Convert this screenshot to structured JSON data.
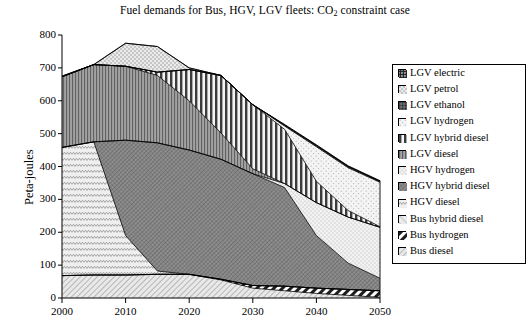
{
  "title": {
    "text_before": "Fuel demands for Bus, HGV, LGV fleets: CO",
    "subscript": "2",
    "text_after": " constraint case",
    "full": "Fuel demands for Bus, HGV, LGV fleets: CO2 constraint case"
  },
  "axes": {
    "ylabel": "Peta-joules",
    "yticks": [
      "0",
      "100",
      "200",
      "300",
      "400",
      "500",
      "600",
      "700",
      "800"
    ],
    "xticks": [
      "2000",
      "2010",
      "2020",
      "2030",
      "2040",
      "2050"
    ]
  },
  "legend": {
    "items": [
      {
        "label": "LGV electric",
        "pattern": "grid-dense-dark",
        "color": "#909090"
      },
      {
        "label": "LGV petrol",
        "pattern": "dot-sparse",
        "color": "#e8e8e8"
      },
      {
        "label": "LGV ethanol",
        "pattern": "grid-solid-dark",
        "color": "#707070"
      },
      {
        "label": "LGV hydrogen",
        "pattern": "dot-fine-light",
        "color": "#efefef"
      },
      {
        "label": "LGV hybrid diesel",
        "pattern": "vertical-thick",
        "color": "#a8a8a8"
      },
      {
        "label": "LGV diesel",
        "pattern": "vertical-fine",
        "color": "#9a9a9a"
      },
      {
        "label": "HGV hydrogen",
        "pattern": "dot-light-box",
        "color": "#ededed"
      },
      {
        "label": "HGV hybrid diesel",
        "pattern": "cross-dense",
        "color": "#8a8a8a"
      },
      {
        "label": "HGV diesel",
        "pattern": "wave-light",
        "color": "#e4e4e4"
      },
      {
        "label": "Bus hybrid diesel",
        "pattern": "diag-light",
        "color": "#e0e0e0"
      },
      {
        "label": "Bus hydrogen",
        "pattern": "diag-thick-dark",
        "color": "#2a2a2a"
      },
      {
        "label": "Bus diesel",
        "pattern": "diag-fine",
        "color": "#dcdcdc"
      }
    ]
  },
  "chart_data": {
    "type": "area",
    "stacked": true,
    "title": "Fuel demands for Bus, HGV, LGV fleets: CO2 constraint case",
    "xlabel": "",
    "ylabel": "Peta-joules",
    "xlim": [
      2000,
      2050
    ],
    "ylim": [
      0,
      800
    ],
    "grid": false,
    "legend_position": "right",
    "x": [
      2000,
      2005,
      2010,
      2015,
      2020,
      2025,
      2030,
      2035,
      2040,
      2045,
      2050
    ],
    "stack_order_bottom_to_top": [
      "Bus diesel",
      "Bus hydrogen",
      "Bus hybrid diesel",
      "HGV diesel",
      "HGV hybrid diesel",
      "HGV hydrogen",
      "LGV diesel",
      "LGV hybrid diesel",
      "LGV hydrogen",
      "LGV ethanol",
      "LGV petrol",
      "LGV electric"
    ],
    "series": [
      {
        "name": "Bus diesel",
        "values": [
          68,
          70,
          70,
          72,
          72,
          55,
          30,
          22,
          14,
          8,
          2
        ]
      },
      {
        "name": "Bus hydrogen",
        "values": [
          0,
          0,
          0,
          0,
          0,
          2,
          8,
          14,
          16,
          18,
          20
        ]
      },
      {
        "name": "Bus hybrid diesel",
        "values": [
          0,
          0,
          0,
          0,
          0,
          0,
          0,
          0,
          0,
          0,
          0
        ]
      },
      {
        "name": "HGV diesel",
        "values": [
          390,
          405,
          120,
          10,
          0,
          0,
          0,
          0,
          0,
          0,
          0
        ]
      },
      {
        "name": "HGV hybrid diesel",
        "values": [
          0,
          0,
          290,
          390,
          378,
          365,
          340,
          300,
          160,
          80,
          38
        ]
      },
      {
        "name": "HGV hydrogen",
        "values": [
          0,
          0,
          0,
          0,
          0,
          0,
          0,
          12,
          100,
          140,
          155
        ]
      },
      {
        "name": "LGV diesel",
        "values": [
          215,
          235,
          225,
          205,
          150,
          80,
          15,
          0,
          0,
          0,
          0
        ]
      },
      {
        "name": "LGV hybrid diesel",
        "values": [
          0,
          0,
          0,
          10,
          95,
          175,
          195,
          165,
          65,
          20,
          2
        ]
      },
      {
        "name": "LGV hydrogen",
        "values": [
          0,
          0,
          0,
          0,
          0,
          0,
          0,
          10,
          105,
          130,
          135
        ]
      },
      {
        "name": "LGV ethanol",
        "values": [
          0,
          0,
          0,
          0,
          0,
          0,
          0,
          3,
          4,
          4,
          3
        ]
      },
      {
        "name": "LGV petrol",
        "values": [
          2,
          0,
          70,
          78,
          5,
          0,
          0,
          0,
          0,
          0,
          0
        ]
      },
      {
        "name": "LGV electric",
        "values": [
          0,
          0,
          0,
          0,
          0,
          0,
          0,
          2,
          2,
          2,
          2
        ]
      }
    ],
    "totals": [
      675,
      710,
      705,
      700,
      700,
      640,
      565,
      515,
      455,
      395,
      355
    ]
  }
}
